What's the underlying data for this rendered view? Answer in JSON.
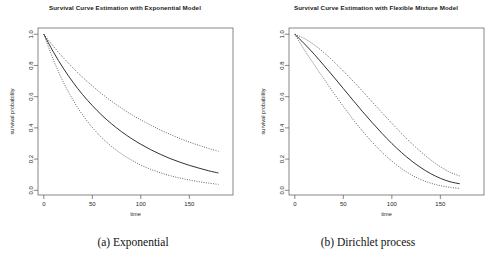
{
  "figure": {
    "background_color": "#ffffff",
    "axis_color": "#555555",
    "curve_color": "#1a1a1a"
  },
  "subfigures": [
    {
      "caption": "(a) Exponential",
      "panel_key": "panel_a"
    },
    {
      "caption": "(b) Dirichlet process",
      "panel_key": "panel_b"
    }
  ],
  "chart_data": [
    {
      "type": "line",
      "title": "Survival Curve Estimation with Exponential Model",
      "xlabel": "time",
      "ylabel": "survival probability",
      "xlim": [
        -6,
        195
      ],
      "ylim": [
        -0.03,
        1.04
      ],
      "xticks": [
        0,
        50,
        100,
        150
      ],
      "xtick_labels": [
        "0",
        "50",
        "100",
        "150"
      ],
      "yticks": [
        0.0,
        0.2,
        0.4,
        0.6,
        0.8,
        1.0
      ],
      "ytick_labels": [
        "0.0",
        "0.2",
        "0.4",
        "0.6",
        "0.8",
        "1.0"
      ],
      "grid": false,
      "legend": "none",
      "x": [
        0,
        10,
        20,
        30,
        40,
        50,
        60,
        70,
        80,
        90,
        100,
        110,
        120,
        130,
        140,
        150,
        160,
        170,
        180
      ],
      "series": [
        {
          "name": "posterior mean survival",
          "style": "solid",
          "values": [
            1.0,
            0.885,
            0.783,
            0.693,
            0.613,
            0.543,
            0.48,
            0.425,
            0.376,
            0.333,
            0.295,
            0.261,
            0.231,
            0.204,
            0.181,
            0.16,
            0.142,
            0.125,
            0.111
          ]
        },
        {
          "name": "upper credible band",
          "style": "dotted",
          "values": [
            1.0,
            0.922,
            0.85,
            0.785,
            0.724,
            0.669,
            0.617,
            0.57,
            0.527,
            0.487,
            0.451,
            0.418,
            0.387,
            0.359,
            0.333,
            0.309,
            0.288,
            0.268,
            0.25
          ]
        },
        {
          "name": "lower credible band",
          "style": "dotted",
          "values": [
            1.0,
            0.834,
            0.695,
            0.579,
            0.483,
            0.403,
            0.336,
            0.28,
            0.234,
            0.195,
            0.162,
            0.135,
            0.113,
            0.094,
            0.079,
            0.066,
            0.055,
            0.046,
            0.038
          ]
        }
      ]
    },
    {
      "type": "line",
      "title": "Survival Curve Estimation with Flexible Mixture Model",
      "xlabel": "time",
      "ylabel": "survival probability",
      "xlim": [
        -6,
        195
      ],
      "ylim": [
        -0.03,
        1.04
      ],
      "xticks": [
        0,
        50,
        100,
        150
      ],
      "xtick_labels": [
        "0",
        "50",
        "100",
        "150"
      ],
      "yticks": [
        0.0,
        0.2,
        0.4,
        0.6,
        0.8,
        1.0
      ],
      "ytick_labels": [
        "0.0",
        "0.2",
        "0.4",
        "0.6",
        "0.8",
        "1.0"
      ],
      "grid": false,
      "legend": "none",
      "x": [
        0,
        10,
        20,
        30,
        40,
        50,
        60,
        70,
        80,
        90,
        100,
        110,
        120,
        130,
        140,
        150,
        160,
        170
      ],
      "series": [
        {
          "name": "posterior mean survival",
          "style": "solid",
          "values": [
            1.0,
            0.938,
            0.872,
            0.8,
            0.727,
            0.652,
            0.577,
            0.503,
            0.432,
            0.364,
            0.3,
            0.242,
            0.19,
            0.145,
            0.107,
            0.077,
            0.055,
            0.042
          ]
        },
        {
          "name": "upper credible band",
          "style": "dotted",
          "values": [
            1.0,
            0.972,
            0.932,
            0.882,
            0.826,
            0.765,
            0.7,
            0.633,
            0.565,
            0.497,
            0.43,
            0.365,
            0.303,
            0.246,
            0.195,
            0.151,
            0.116,
            0.092
          ]
        },
        {
          "name": "lower credible band",
          "style": "dotted",
          "values": [
            1.0,
            0.898,
            0.805,
            0.714,
            0.624,
            0.538,
            0.455,
            0.378,
            0.307,
            0.243,
            0.187,
            0.139,
            0.1,
            0.069,
            0.046,
            0.03,
            0.019,
            0.012
          ]
        }
      ]
    }
  ]
}
